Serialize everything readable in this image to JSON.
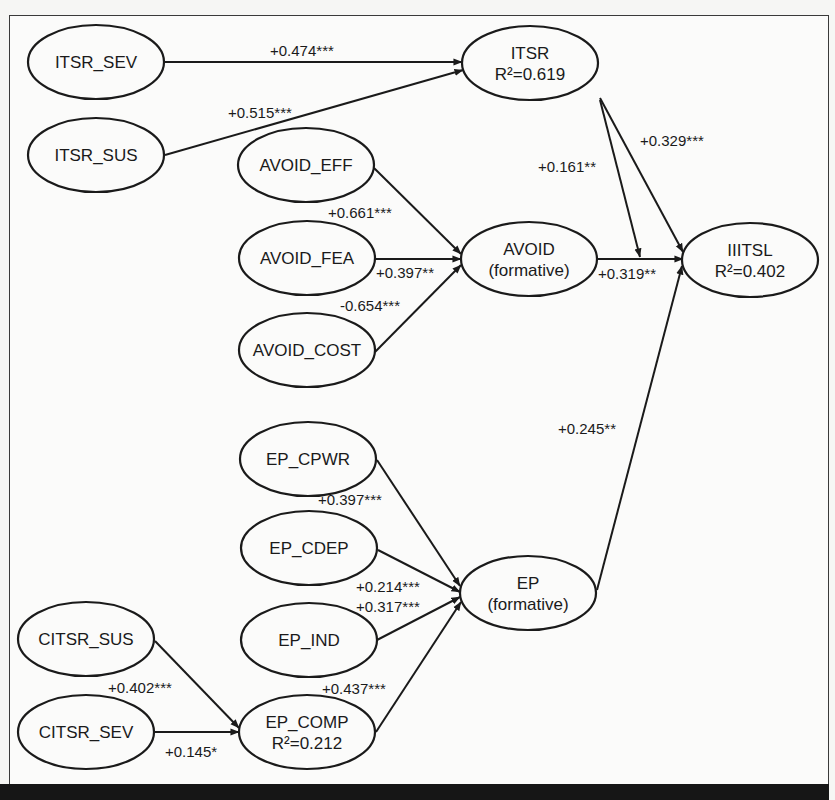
{
  "diagram": {
    "type": "structural-equation-model",
    "nodes": [
      {
        "id": "ITSR_SEV",
        "lines": [
          "ITSR_SEV"
        ],
        "cx": 96,
        "cy": 62
      },
      {
        "id": "ITSR_SUS",
        "lines": [
          "ITSR_SUS"
        ],
        "cx": 96,
        "cy": 155
      },
      {
        "id": "ITSR",
        "lines": [
          "ITSR",
          "R²=0.619"
        ],
        "cx": 530,
        "cy": 63
      },
      {
        "id": "AVOID_EFF",
        "lines": [
          "AVOID_EFF"
        ],
        "cx": 306,
        "cy": 165
      },
      {
        "id": "AVOID_FEA",
        "lines": [
          "AVOID_FEA"
        ],
        "cx": 307,
        "cy": 258
      },
      {
        "id": "AVOID_COST",
        "lines": [
          "AVOID_COST"
        ],
        "cx": 307,
        "cy": 350
      },
      {
        "id": "AVOID",
        "lines": [
          "AVOID",
          "(formative)"
        ],
        "cx": 529,
        "cy": 259
      },
      {
        "id": "IIITSL",
        "lines": [
          "IIITSL",
          "R²=0.402"
        ],
        "cx": 750,
        "cy": 260
      },
      {
        "id": "EP_CPWR",
        "lines": [
          "EP_CPWR"
        ],
        "cx": 308,
        "cy": 459
      },
      {
        "id": "EP_CDEP",
        "lines": [
          "EP_CDEP"
        ],
        "cx": 309,
        "cy": 548
      },
      {
        "id": "EP_IND",
        "lines": [
          "EP_IND"
        ],
        "cx": 309,
        "cy": 640
      },
      {
        "id": "EP_COMP",
        "lines": [
          "EP_COMP",
          "R²=0.212"
        ],
        "cx": 307,
        "cy": 732
      },
      {
        "id": "EP",
        "lines": [
          "EP",
          "(formative)"
        ],
        "cx": 528,
        "cy": 593
      },
      {
        "id": "CITSR_SUS",
        "lines": [
          "CITSR_SUS"
        ],
        "cx": 86,
        "cy": 639
      },
      {
        "id": "CITSR_SEV",
        "lines": [
          "CITSR_SEV"
        ],
        "cx": 86,
        "cy": 732
      }
    ],
    "paths": [
      {
        "from": "ITSR_SEV",
        "to": "ITSR",
        "coef": "+0.474***",
        "x1": 165,
        "y1": 62,
        "x2": 462,
        "y2": 62,
        "lx": 270,
        "ly": 56
      },
      {
        "from": "ITSR_SUS",
        "to": "ITSR",
        "coef": "+0.515***",
        "x1": 165,
        "y1": 155,
        "x2": 463,
        "y2": 70,
        "lx": 228,
        "ly": 118
      },
      {
        "from": "AVOID_EFF",
        "to": "AVOID",
        "coef": "+0.661***",
        "x1": 374,
        "y1": 168,
        "x2": 461,
        "y2": 254,
        "lx": 328,
        "ly": 218
      },
      {
        "from": "AVOID_FEA",
        "to": "AVOID",
        "coef": "+0.397**",
        "x1": 375,
        "y1": 259,
        "x2": 461,
        "y2": 259,
        "lx": 376,
        "ly": 278
      },
      {
        "from": "AVOID_COST",
        "to": "AVOID",
        "coef": "-0.654***",
        "x1": 375,
        "y1": 352,
        "x2": 461,
        "y2": 265,
        "lx": 340,
        "ly": 311
      },
      {
        "from": "ITSR",
        "to": "IIITSL",
        "coef": "+0.329***",
        "x1": 600,
        "y1": 98,
        "x2": 683,
        "y2": 252,
        "lx": 640,
        "ly": 146
      },
      {
        "from": "ITSR",
        "to": "AVOID->IIITSL",
        "coef": "+0.161**",
        "x1": 600,
        "y1": 100,
        "x2": 640,
        "y2": 257,
        "lx": 538,
        "ly": 172
      },
      {
        "from": "AVOID",
        "to": "IIITSL",
        "coef": "+0.319**",
        "x1": 597,
        "y1": 259,
        "x2": 683,
        "y2": 259,
        "lx": 598,
        "ly": 279
      },
      {
        "from": "EP",
        "to": "IIITSL",
        "coef": "+0.245**",
        "x1": 597,
        "y1": 590,
        "x2": 682,
        "y2": 266,
        "lx": 558,
        "ly": 434
      },
      {
        "from": "EP_CPWR",
        "to": "EP",
        "coef": "+0.397***",
        "x1": 377,
        "y1": 460,
        "x2": 460,
        "y2": 586,
        "lx": 318,
        "ly": 505
      },
      {
        "from": "EP_CDEP",
        "to": "EP",
        "coef": "+0.214***",
        "x1": 378,
        "y1": 550,
        "x2": 460,
        "y2": 592,
        "lx": 356,
        "ly": 592
      },
      {
        "from": "EP_IND",
        "to": "EP",
        "coef": "+0.317***",
        "x1": 377,
        "y1": 640,
        "x2": 460,
        "y2": 597,
        "lx": 356,
        "ly": 612
      },
      {
        "from": "EP_COMP",
        "to": "EP",
        "coef": "+0.437***",
        "x1": 376,
        "y1": 732,
        "x2": 461,
        "y2": 602,
        "lx": 322,
        "ly": 694
      },
      {
        "from": "CITSR_SUS",
        "to": "EP_COMP",
        "coef": "+0.402***",
        "x1": 155,
        "y1": 641,
        "x2": 239,
        "y2": 728,
        "lx": 108,
        "ly": 693
      },
      {
        "from": "CITSR_SEV",
        "to": "EP_COMP",
        "coef": "+0.145*",
        "x1": 155,
        "y1": 732,
        "x2": 239,
        "y2": 732,
        "lx": 165,
        "ly": 757
      }
    ],
    "style": {
      "node_rx": 68,
      "node_ry": 37,
      "stroke": "#1a1a1a",
      "node_fill": "#fbfbfa"
    }
  }
}
